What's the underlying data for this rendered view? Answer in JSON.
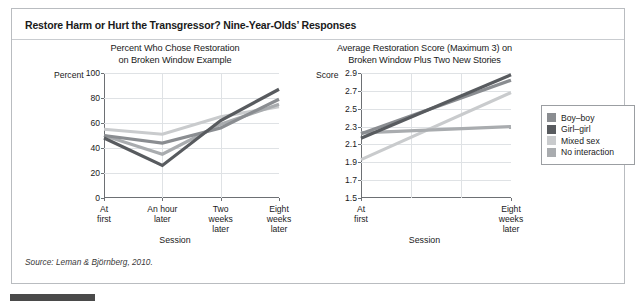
{
  "figure": {
    "title": "Restore Harm or Hurt the Transgressor? Nine-Year-Olds’ Responses",
    "source": "Source: Leman & Björnberg, 2010."
  },
  "legend": {
    "position": "right",
    "items": [
      {
        "label": "Boy–boy",
        "color": "#8a8d91"
      },
      {
        "label": "Girl–girl",
        "color": "#585b5f"
      },
      {
        "label": "Mixed sex",
        "color": "#c9cbcd"
      },
      {
        "label": "No interaction",
        "color": "#a9acaf"
      }
    ]
  },
  "chart_data": [
    {
      "id": "left",
      "type": "line",
      "title": "Percent Who Chose Restoration on Broken Window Example",
      "title_line1": "Percent Who Chose Restoration",
      "title_line2": "on Broken Window Example",
      "xlabel": "Session",
      "ylabel": "Percent",
      "ylim": [
        0,
        100
      ],
      "yticks": [
        0,
        20,
        40,
        60,
        80,
        100
      ],
      "ytick_labels": [
        "0",
        "20",
        "40",
        "60",
        "80",
        "100"
      ],
      "gridlines": [
        "horizontal",
        "vertical"
      ],
      "categories": [
        "At first",
        "An hour later",
        "Two weeks later",
        "Eight weeks later"
      ],
      "category_lines": [
        [
          "At",
          "first"
        ],
        [
          "An hour",
          "later"
        ],
        [
          "Two",
          "weeks",
          "later"
        ],
        [
          "Eight",
          "weeks",
          "later"
        ]
      ],
      "series": [
        {
          "name": "Boy–boy",
          "color": "#8a8d91",
          "values": [
            50,
            44,
            56,
            79
          ]
        },
        {
          "name": "Girl–girl",
          "color": "#585b5f",
          "values": [
            48,
            26,
            62,
            87
          ]
        },
        {
          "name": "Mixed sex",
          "color": "#c9cbcd",
          "values": [
            55,
            51,
            65,
            73
          ]
        },
        {
          "name": "No interaction",
          "color": "#a9acaf",
          "values": [
            50,
            35,
            59,
            75
          ]
        }
      ]
    },
    {
      "id": "right",
      "type": "line",
      "title": "Average Restoration Score (Maximum 3) on Broken Window Plus Two New Stories",
      "title_line1": "Average Restoration Score (Maximum 3) on",
      "title_line2": "Broken Window Plus Two New Stories",
      "xlabel": "Session",
      "ylabel": "Score",
      "ylim": [
        1.5,
        2.9
      ],
      "yticks": [
        1.5,
        1.7,
        1.9,
        2.1,
        2.3,
        2.5,
        2.7,
        2.9
      ],
      "ytick_labels": [
        "1.5",
        "1.7",
        "1.9",
        "2.1",
        "2.3",
        "2.5",
        "2.7",
        "2.9"
      ],
      "gridlines": [
        "horizontal",
        "vertical"
      ],
      "categories": [
        "At first",
        "Eight weeks later"
      ],
      "category_lines": [
        [
          "At",
          "first"
        ],
        [
          "Eight",
          "weeks",
          "later"
        ]
      ],
      "series": [
        {
          "name": "Boy–boy",
          "color": "#8a8d91",
          "values": [
            2.22,
            2.82
          ]
        },
        {
          "name": "Girl–girl",
          "color": "#585b5f",
          "values": [
            2.17,
            2.88
          ]
        },
        {
          "name": "Mixed sex",
          "color": "#c9cbcd",
          "values": [
            1.93,
            2.68
          ]
        },
        {
          "name": "No interaction",
          "color": "#a9acaf",
          "values": [
            2.23,
            2.3
          ]
        }
      ]
    }
  ]
}
